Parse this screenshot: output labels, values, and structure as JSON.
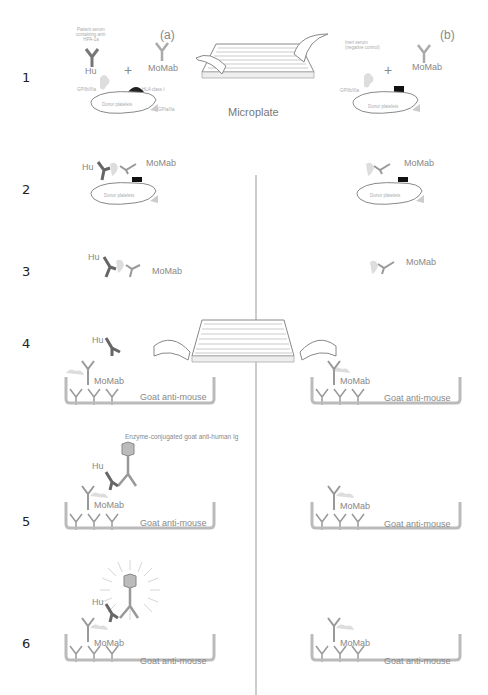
{
  "figure": {
    "panels": {
      "a": "(a)",
      "b": "(b)"
    },
    "steps": [
      "1",
      "2",
      "3",
      "4",
      "5",
      "6"
    ],
    "microplate_label": "Microplate",
    "labels": {
      "hu": "Hu",
      "momab": "MoMab",
      "plus": "+",
      "donor_platelets": "Donor platelets",
      "goat_anti_mouse": "Goat anti-mouse",
      "enzyme_conjugate": "Enzyme-conjugated goat anti-human Ig",
      "patient_serum": "Patient serum containing anti-HPA-1a",
      "inert_serum": "Inert serum (negative control)",
      "gpiibiiia": "GPIIb/IIIa",
      "hla_class_i": "HLA class I",
      "gpia_iia": "GPIa/IIa"
    },
    "colors": {
      "human_antibody": "#666666",
      "mouse_antibody": "#999999",
      "glycoprotein": "#cccccc",
      "well": "#bbbbbb",
      "divider": "#cccccc"
    }
  }
}
